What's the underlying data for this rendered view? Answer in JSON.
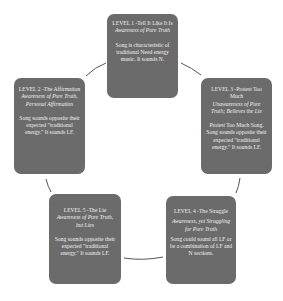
{
  "diagram": {
    "type": "cycle",
    "colors": {
      "box": "#6b6b6b",
      "text": "#f2f2f2",
      "connector": "#555555"
    },
    "levels": [
      {
        "title": "LEVEL 1 -Tell It Like It Is",
        "subtitle": "Awareness of Pure Truth",
        "description": "Song is characteristic of traditional Need energy music. It sounds N."
      },
      {
        "title": "LEVEL 2 -The Affirmation",
        "subtitle": "Awareness of Pure Truth, Personal Affirmation",
        "description": "Song sounds opposite their expected \"traditional energy.\" It sounds LF."
      },
      {
        "title": "LEVEL 3 -Protest Too Much",
        "subtitle": "Unawareness of Pure Truth; Believes the Lie",
        "description": "Protest Too Much Song. Song sounds opposite their expected \"traditional energy.\" It sounds LF."
      },
      {
        "title": "LEVEL 4 -The Struggle",
        "subtitle": "Awareness, yet Struggling for Pure Truth",
        "description": "Song could sound all LF or be a combination of LF and N sections."
      },
      {
        "title": "LEVEL 5 -The Lie",
        "subtitle": "Awareness of Pure Truth, but Lies",
        "description": "Song sounds opposite their expected \"traditional energy.\" It sounds LF."
      }
    ]
  }
}
